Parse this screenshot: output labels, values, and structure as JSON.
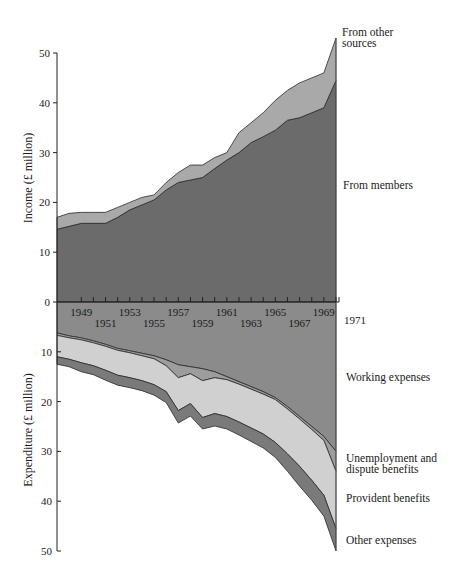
{
  "chart_data": {
    "type": "area",
    "title": "",
    "x": [
      1947,
      1948,
      1949,
      1950,
      1951,
      1952,
      1953,
      1954,
      1955,
      1956,
      1957,
      1958,
      1959,
      1960,
      1961,
      1962,
      1963,
      1964,
      1965,
      1966,
      1967,
      1968,
      1969,
      1970
    ],
    "xlabel": "",
    "x_tick_labels": [
      "1949",
      "1951",
      "1953",
      "1955",
      "1957",
      "1959",
      "1961",
      "1963",
      "1965",
      "1967",
      "1969",
      "1971"
    ],
    "panels": [
      {
        "name": "income",
        "ylabel": "Income (£ million)",
        "ylim": [
          0,
          50
        ],
        "y_ticks": [
          0,
          10,
          20,
          30,
          40,
          50
        ],
        "stacked": true,
        "series": [
          {
            "name": "From members",
            "color": "#6b6b6b",
            "values": [
              14.6,
              15.2,
              15.8,
              15.8,
              15.8,
              17.0,
              18.5,
              19.5,
              20.5,
              22.5,
              24.0,
              24.5,
              25.0,
              26.8,
              28.5,
              30.0,
              32.0,
              33.2,
              34.5,
              36.5,
              37.0,
              38.0,
              39.0,
              44.5
            ]
          },
          {
            "name": "From other sources",
            "color": "#a9a9a9",
            "values": [
              2.4,
              2.6,
              2.2,
              2.2,
              2.2,
              2.0,
              1.5,
              1.5,
              1.0,
              1.5,
              2.0,
              3.0,
              2.5,
              2.2,
              1.5,
              4.0,
              4.0,
              4.8,
              6.0,
              6.0,
              7.0,
              7.0,
              7.0,
              8.5
            ]
          }
        ]
      },
      {
        "name": "expenditure",
        "ylabel": "Expenditure (£ million)",
        "ylim": [
          0,
          50
        ],
        "y_ticks": [
          10,
          20,
          30,
          40,
          50
        ],
        "inverted": true,
        "stacked": true,
        "series": [
          {
            "name": "Working expenses",
            "color": "#8b8b8b",
            "values": [
              6.2,
              6.8,
              7.2,
              7.8,
              8.5,
              9.3,
              9.8,
              10.3,
              10.8,
              11.6,
              12.6,
              13.0,
              13.4,
              14.0,
              15.0,
              16.0,
              17.0,
              18.0,
              19.2,
              21.0,
              23.0,
              25.0,
              27.0,
              30.0
            ]
          },
          {
            "name": "Unemployment and dispute benefits",
            "color": "#9d9d9d",
            "values": [
              0.5,
              0.4,
              0.4,
              0.4,
              0.4,
              0.4,
              0.4,
              0.5,
              0.6,
              1.2,
              2.6,
              1.4,
              2.4,
              1.2,
              0.6,
              0.5,
              0.5,
              0.5,
              0.4,
              0.5,
              0.5,
              0.6,
              0.8,
              4.0
            ]
          },
          {
            "name": "Provident benefits",
            "color": "#d0d0d0",
            "values": [
              4.3,
              4.3,
              4.6,
              4.6,
              4.8,
              5.0,
              5.0,
              5.0,
              5.2,
              5.2,
              6.6,
              6.0,
              7.4,
              7.2,
              7.4,
              7.6,
              7.8,
              8.0,
              8.6,
              9.0,
              9.5,
              10.2,
              11.0,
              11.5
            ]
          },
          {
            "name": "Other expenses",
            "color": "#7a7a7a",
            "values": [
              1.5,
              1.5,
              1.8,
              1.8,
              2.0,
              2.0,
              2.0,
              2.0,
              2.1,
              2.2,
              2.5,
              2.5,
              2.3,
              2.5,
              2.5,
              2.6,
              2.7,
              2.8,
              3.0,
              3.5,
              4.0,
              4.0,
              4.2,
              4.5
            ]
          }
        ]
      }
    ],
    "grid": false,
    "legend_position": "right (inline labels)"
  },
  "labels": {
    "income_axis_title": "Income (£ million)",
    "expenditure_axis_title": "Expenditure (£ million)",
    "from_other_sources": "From other\nsources",
    "from_members": "From members",
    "working_expenses": "Working expenses",
    "unemployment": "Unemployment and\ndispute benefits",
    "provident": "Provident benefits",
    "other_expenses": "Other expenses"
  }
}
